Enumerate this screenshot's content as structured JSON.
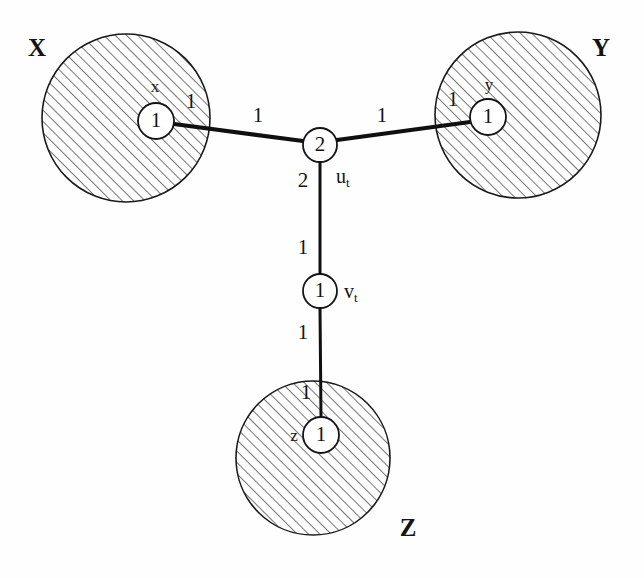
{
  "figure": {
    "type": "weighted-graph-diagram",
    "background_color": "#fefefe",
    "ink_color": "#141414",
    "hatch_color": "#555555",
    "clusters": [
      {
        "id": "X",
        "label": "X",
        "label_x": 37,
        "label_y": 50,
        "cx": 126,
        "cy": 118,
        "r": 84,
        "terminal": {
          "name": "x",
          "value": "1",
          "cx": 156,
          "cy": 121,
          "r": 18,
          "name_x": 155,
          "name_y": 88
        }
      },
      {
        "id": "Y",
        "label": "Y",
        "label_x": 601,
        "label_y": 50,
        "cx": 518,
        "cy": 115,
        "r": 83,
        "terminal": {
          "name": "y",
          "value": "1",
          "cx": 488,
          "cy": 117,
          "r": 18,
          "name_x": 489,
          "name_y": 86
        }
      },
      {
        "id": "Z",
        "label": "Z",
        "label_x": 408,
        "label_y": 530,
        "cx": 313,
        "cy": 458,
        "r": 77,
        "terminal": {
          "name": "z",
          "value": "1",
          "cx": 321,
          "cy": 435,
          "r": 18,
          "name_x": 294,
          "name_y": 437
        }
      }
    ],
    "inner_nodes": [
      {
        "id": "u_t",
        "name": "u",
        "subscript": "t",
        "value": "2",
        "cx": 320,
        "cy": 145,
        "r": 17,
        "label_x": 343,
        "label_y": 178
      },
      {
        "id": "v_t",
        "name": "v",
        "subscript": "t",
        "value": "1",
        "cx": 320,
        "cy": 291,
        "r": 17,
        "label_x": 344,
        "label_y": 293
      }
    ],
    "edges": [
      {
        "id": "edge-x-u",
        "from": "x",
        "to": "u_t",
        "x1": 174,
        "y1": 124,
        "x2": 303,
        "y2": 141,
        "weight_near_source": "1",
        "weight_near_source_x": 191,
        "weight_near_source_y": 103,
        "weight_near_target": "1",
        "weight_near_target_x": 258,
        "weight_near_target_y": 117
      },
      {
        "id": "edge-u-y",
        "from": "u_t",
        "to": "y",
        "x1": 337,
        "y1": 140,
        "x2": 470,
        "y2": 122,
        "weight_near_source": "1",
        "weight_near_source_x": 382,
        "weight_near_source_y": 117,
        "weight_near_target": "1",
        "weight_near_target_x": 453,
        "weight_near_target_y": 101
      },
      {
        "id": "edge-u-v",
        "from": "u_t",
        "to": "v_t",
        "x1": 320,
        "y1": 162,
        "x2": 320,
        "y2": 274,
        "weight_near_source": "2",
        "weight_near_source_x": 303,
        "weight_near_source_y": 182,
        "weight_near_target": "1",
        "weight_near_target_x": 303,
        "weight_near_target_y": 249
      },
      {
        "id": "edge-v-z",
        "from": "v_t",
        "to": "z",
        "x1": 320,
        "y1": 308,
        "x2": 321,
        "y2": 417,
        "weight_near_source": "1",
        "weight_near_source_x": 303,
        "weight_near_source_y": 334,
        "weight_near_target": "1",
        "weight_near_target_x": 306,
        "weight_near_target_y": 394
      }
    ]
  }
}
